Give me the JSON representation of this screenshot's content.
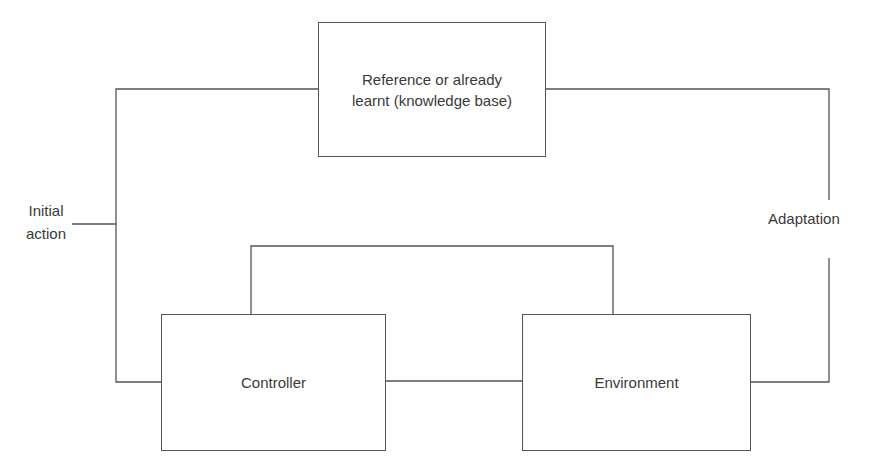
{
  "diagram": {
    "type": "control-loop block diagram",
    "nodes": {
      "knowledge_base": {
        "label_line1": "Reference or already",
        "label_line2": "learnt (knowledge base)"
      },
      "controller": {
        "label": "Controller"
      },
      "environment": {
        "label": "Environment"
      }
    },
    "edge_labels": {
      "initial_action_line1": "Initial",
      "initial_action_line2": "action",
      "adaptation": "Adaptation"
    },
    "edges": [
      {
        "from": "initial_action",
        "to": "left_bus"
      },
      {
        "from": "knowledge_base",
        "to": "controller",
        "via": "left_bus"
      },
      {
        "from": "controller",
        "to": "environment",
        "via": "direct"
      },
      {
        "from": "controller",
        "to": "environment",
        "via": "upper_loop"
      },
      {
        "from": "environment",
        "to": "knowledge_base",
        "via": "right_bus",
        "label": "Adaptation"
      }
    ],
    "colors": {
      "stroke": "#555555",
      "text": "#3a3a3a",
      "background": "#ffffff"
    }
  }
}
